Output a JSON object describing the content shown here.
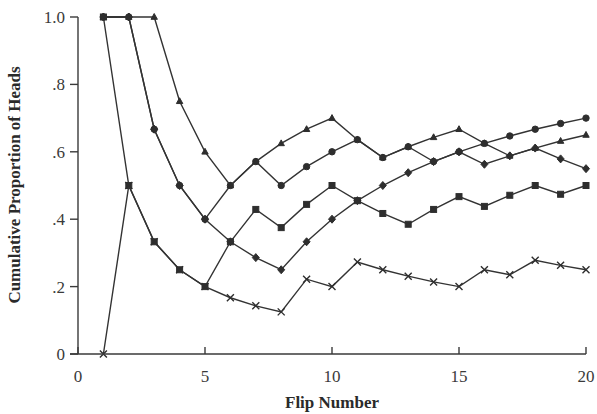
{
  "chart_data": {
    "type": "line",
    "title": "",
    "xlabel": "Flip Number",
    "ylabel": "Cumulative Proportion of Heads",
    "xlim": [
      0,
      20
    ],
    "ylim": [
      0,
      1.0
    ],
    "x_ticks": [
      0,
      5,
      10,
      15,
      20
    ],
    "x_tick_labels": [
      "0",
      "5",
      "10",
      "15",
      "20"
    ],
    "y_ticks": [
      0,
      0.2,
      0.4,
      0.6,
      0.8,
      1.0
    ],
    "y_tick_labels": [
      "0",
      ".2",
      ".4",
      ".6",
      ".8",
      "1.0"
    ],
    "grid": false,
    "legend": "none",
    "x": [
      1,
      2,
      3,
      4,
      5,
      6,
      7,
      8,
      9,
      10,
      11,
      12,
      13,
      14,
      15,
      16,
      17,
      18,
      19,
      20
    ],
    "series": [
      {
        "name": "Series 1 (circle)",
        "marker": "circle",
        "values": [
          1.0,
          1.0,
          0.667,
          0.5,
          0.4,
          0.5,
          0.571,
          0.5,
          0.556,
          0.6,
          0.636,
          0.583,
          0.615,
          0.571,
          0.6,
          0.625,
          0.647,
          0.667,
          0.684,
          0.7
        ]
      },
      {
        "name": "Series 2 (triangle)",
        "marker": "triangle",
        "values": [
          1.0,
          1.0,
          1.0,
          0.75,
          0.6,
          0.5,
          0.571,
          0.625,
          0.667,
          0.7,
          0.636,
          0.583,
          0.615,
          0.643,
          0.667,
          0.625,
          0.588,
          0.611,
          0.632,
          0.65
        ]
      },
      {
        "name": "Series 3 (diamond)",
        "marker": "diamond",
        "values": [
          1.0,
          1.0,
          0.667,
          0.5,
          0.4,
          0.333,
          0.286,
          0.25,
          0.333,
          0.4,
          0.455,
          0.5,
          0.538,
          0.571,
          0.6,
          0.563,
          0.588,
          0.611,
          0.579,
          0.55
        ]
      },
      {
        "name": "Series 4 (square)",
        "marker": "square",
        "values": [
          1.0,
          0.5,
          0.333,
          0.25,
          0.2,
          0.333,
          0.429,
          0.375,
          0.444,
          0.5,
          0.455,
          0.417,
          0.385,
          0.429,
          0.467,
          0.438,
          0.471,
          0.5,
          0.474,
          0.5
        ]
      },
      {
        "name": "Series 5 (x)",
        "marker": "x",
        "values": [
          0.0,
          0.5,
          0.333,
          0.25,
          0.2,
          0.167,
          0.143,
          0.125,
          0.222,
          0.2,
          0.273,
          0.25,
          0.231,
          0.214,
          0.2,
          0.25,
          0.235,
          0.278,
          0.263,
          0.25
        ]
      }
    ]
  }
}
